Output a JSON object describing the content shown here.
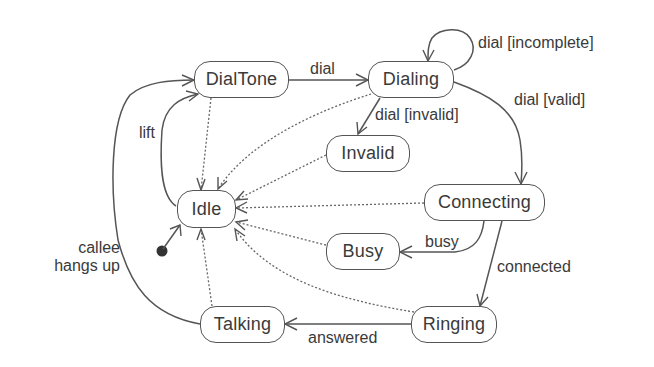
{
  "diagram": {
    "type": "state-machine",
    "title": "",
    "initial_state": "Idle",
    "states": [
      {
        "id": "DialTone",
        "label": "DialTone"
      },
      {
        "id": "Dialing",
        "label": "Dialing"
      },
      {
        "id": "Invalid",
        "label": "Invalid"
      },
      {
        "id": "Idle",
        "label": "Idle"
      },
      {
        "id": "Connecting",
        "label": "Connecting"
      },
      {
        "id": "Busy",
        "label": "Busy"
      },
      {
        "id": "Ringing",
        "label": "Ringing"
      },
      {
        "id": "Talking",
        "label": "Talking"
      }
    ],
    "transitions": [
      {
        "from": "Idle",
        "to": "DialTone",
        "label": "lift",
        "style": "solid"
      },
      {
        "from": "DialTone",
        "to": "Dialing",
        "label": "dial",
        "style": "solid"
      },
      {
        "from": "Dialing",
        "to": "Dialing",
        "label": "dial [incomplete]",
        "style": "solid"
      },
      {
        "from": "Dialing",
        "to": "Invalid",
        "label": "dial [invalid]",
        "style": "solid"
      },
      {
        "from": "Dialing",
        "to": "Connecting",
        "label": "dial [valid]",
        "style": "solid"
      },
      {
        "from": "Connecting",
        "to": "Busy",
        "label": "busy",
        "style": "solid"
      },
      {
        "from": "Connecting",
        "to": "Ringing",
        "label": "connected",
        "style": "solid"
      },
      {
        "from": "Ringing",
        "to": "Talking",
        "label": "answered",
        "style": "solid"
      },
      {
        "from": "Talking",
        "to": "DialTone",
        "label": "callee\nhangs up",
        "style": "solid"
      },
      {
        "from": "DialTone",
        "to": "Idle",
        "label": "",
        "style": "dotted"
      },
      {
        "from": "Dialing",
        "to": "Idle",
        "label": "",
        "style": "dotted"
      },
      {
        "from": "Invalid",
        "to": "Idle",
        "label": "",
        "style": "dotted"
      },
      {
        "from": "Connecting",
        "to": "Idle",
        "label": "",
        "style": "dotted"
      },
      {
        "from": "Busy",
        "to": "Idle",
        "label": "",
        "style": "dotted"
      },
      {
        "from": "Ringing",
        "to": "Idle",
        "label": "",
        "style": "dotted"
      },
      {
        "from": "Talking",
        "to": "Idle",
        "label": "",
        "style": "dotted"
      }
    ]
  },
  "labels": {
    "lift": "lift",
    "dial": "dial",
    "dial_incomplete": "dial [incomplete]",
    "dial_valid": "dial [valid]",
    "dial_invalid": "dial [invalid]",
    "busy": "busy",
    "connected": "connected",
    "answered": "answered",
    "callee_hangs_up": "callee\nhangs up"
  },
  "colors": {
    "line": "#555555",
    "text": "#3a3a3a",
    "background": "#ffffff",
    "initial_dot": "#333333"
  }
}
